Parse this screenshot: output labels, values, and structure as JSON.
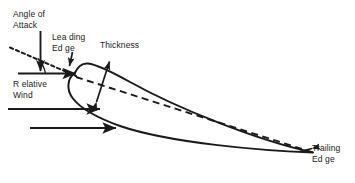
{
  "diagram": {
    "stroke_color": "#1a1a1a",
    "background_color": "#ffffff",
    "labels": {
      "angle_of_attack": "Angle of\nAttack",
      "leading_edge": "Lea ding\nEd ge",
      "thickness": "Thickness",
      "relative_wind": "R elative\nWind",
      "trailing_edge": "Trailing\nEd ge"
    },
    "icons": {
      "angle_arrow": "down-arrow-icon",
      "leading_edge_arrow": "leader-arrow-icon",
      "thickness_arrow": "double-headed-arrow-icon",
      "wind_arrow_top": "right-arrow-icon",
      "wind_arrow_middle": "right-arrow-icon",
      "wind_arrow_bottom": "right-arrow-icon",
      "trailing_edge_arrow": "leader-arrow-icon"
    },
    "elements": {
      "airfoil_body": "airfoil-outline",
      "chord_line": "dashed-chord-line",
      "chord_extension": "dotted-chord-extension",
      "angle_arc": "angle-of-attack-arc",
      "relative_wind_line": "relative-wind-reference-line"
    }
  }
}
